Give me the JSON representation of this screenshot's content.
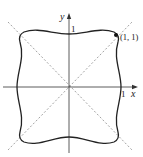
{
  "figure": {
    "axes": {
      "x_label": "x",
      "y_label": "y",
      "x_tick": "1",
      "y_tick": "1"
    },
    "point": {
      "label": "(1, 1)"
    },
    "curve": {
      "description": "closed symmetric curve with bulging corners, symmetric about axes and diagonals",
      "color": "#222222"
    },
    "diagonals": {
      "style": "dashed",
      "color": "#888888",
      "lines": [
        "y = x",
        "y = -x"
      ]
    }
  }
}
